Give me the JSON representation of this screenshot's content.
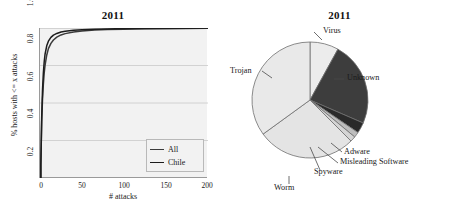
{
  "figure": {
    "background": "#ffffff",
    "panels": 2
  },
  "chart_data": [
    {
      "type": "line",
      "title": "2011",
      "xlabel": "# attacks",
      "ylabel": "% hosts with <= x attacks",
      "xlim": [
        0,
        200
      ],
      "ylim": [
        0.2,
        1.0
      ],
      "xticks": [
        "0",
        "50",
        "100",
        "150",
        "200"
      ],
      "xtick_values": [
        0,
        50,
        100,
        150,
        200
      ],
      "yticks": [
        "0.2",
        "0.4",
        "0.6",
        "0.8",
        "1.0"
      ],
      "ytick_values": [
        0.2,
        0.4,
        0.6,
        0.8,
        1.0
      ],
      "grid": "horizontal",
      "plot_background": "#f2f2f2",
      "legend_position": "bottom-right",
      "series": [
        {
          "name": "All",
          "color": "#3a3a3a",
          "x": [
            1,
            2,
            3,
            4,
            5,
            6,
            8,
            10,
            13,
            16,
            20,
            25,
            30,
            40,
            50,
            65,
            80,
            100,
            125,
            150,
            175,
            200
          ],
          "y": [
            0.27,
            0.5,
            0.62,
            0.7,
            0.76,
            0.8,
            0.855,
            0.89,
            0.918,
            0.936,
            0.951,
            0.963,
            0.97,
            0.979,
            0.984,
            0.989,
            0.992,
            0.994,
            0.996,
            0.997,
            0.998,
            0.999
          ]
        },
        {
          "name": "Chile",
          "color": "#1c1c1c",
          "x": [
            1,
            2,
            3,
            4,
            5,
            6,
            8,
            10,
            13,
            16,
            20,
            25,
            30,
            40,
            50,
            65,
            80,
            100,
            125,
            150,
            175,
            200
          ],
          "y": [
            0.27,
            0.52,
            0.67,
            0.76,
            0.82,
            0.86,
            0.905,
            0.93,
            0.95,
            0.962,
            0.971,
            0.979,
            0.983,
            0.988,
            0.991,
            0.994,
            0.995,
            0.997,
            0.998,
            0.998,
            0.999,
            1.0
          ]
        }
      ]
    },
    {
      "type": "pie",
      "title": "2011",
      "start_angle_deg": -90,
      "direction": "clockwise",
      "labels": [
        "Virus",
        "Unknown",
        "Adware",
        "Misleading Software",
        "Spyware",
        "Worm",
        "Trojan"
      ],
      "values": [
        8.0,
        23.5,
        3.0,
        1.5,
        1.5,
        27.5,
        35.0
      ],
      "colors": [
        "#ececec",
        "#3d3d3d",
        "#2a2a2a",
        "#bdbdbd",
        "#d4d4d4",
        "#e4e4e4",
        "#e9e9e9"
      ],
      "edge_color": "#6f6f6f"
    }
  ],
  "line_chart": {
    "title": "2011",
    "xlabel": "# attacks",
    "ylabel": "% hosts with <= x attacks",
    "xticks": [
      "0",
      "50",
      "100",
      "150",
      "200"
    ],
    "yticks": [
      "0.2",
      "0.4",
      "0.6",
      "0.8",
      "1.0"
    ],
    "legend": [
      {
        "label": "All"
      },
      {
        "label": "Chile"
      }
    ]
  },
  "pie_chart": {
    "title": "2011",
    "labels": {
      "virus": "Virus",
      "unknown": "Unknown",
      "adware": "Adware",
      "misleading": "Misleading Software",
      "spyware": "Spyware",
      "worm": "Worm",
      "trojan": "Trojan"
    }
  }
}
